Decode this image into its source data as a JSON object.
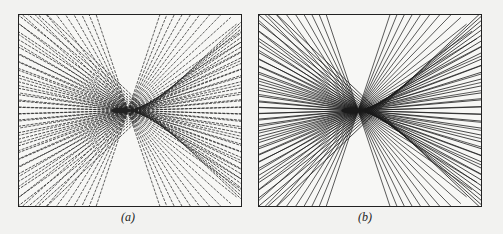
{
  "figure": {
    "panels": [
      {
        "id": "a",
        "caption": "(a)",
        "description": "Line envelope forming a cusp caustic; rays fan from the left converging near center, dense crossing mesh on right",
        "line_color": "#222222",
        "style": "dashed-rough"
      },
      {
        "id": "b",
        "caption": "(b)",
        "description": "Line envelope forming a cusp caustic; smooth solid rays fan from the left converging near center, dense crossing mesh on right",
        "line_color": "#1a1a1a",
        "style": "solid"
      }
    ]
  }
}
